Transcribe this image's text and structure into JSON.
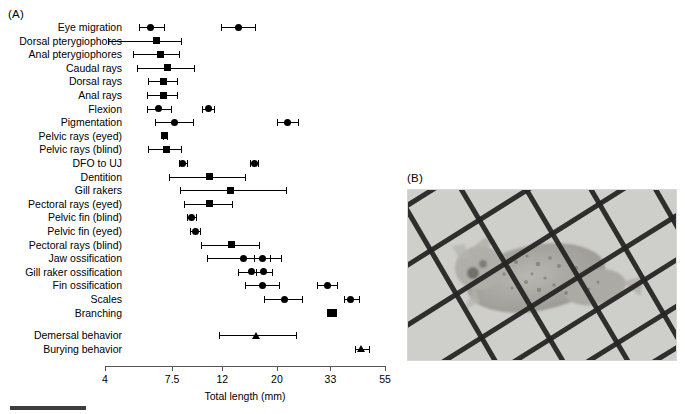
{
  "figure": {
    "panels": [
      {
        "id": "A",
        "letter": "(A)"
      },
      {
        "id": "B",
        "letter": "(B)"
      }
    ]
  },
  "panel_a": {
    "axis_title": "Total length (mm)",
    "axis_ticks": [
      "4",
      "7.5",
      "12",
      "20",
      "33",
      "55"
    ]
  },
  "panel_b": {
    "letter": "(B)",
    "image_description": "grayscale photograph of a settled flatfish larva lying on a dark diagonal grid mesh"
  },
  "chart_data": {
    "type": "scatter",
    "title": "",
    "xlabel": "Total length (mm)",
    "ylabel": "",
    "xscale": "log",
    "xlim": [
      4,
      55
    ],
    "xticks": [
      4,
      7.5,
      12,
      20,
      33,
      55
    ],
    "grid": false,
    "legend": null,
    "categories": [
      "Eye migration",
      "Dorsal pterygiophores",
      "Anal pterygiophores",
      "Caudal rays",
      "Dorsal rays",
      "Anal rays",
      "Flexion",
      "Pigmentation",
      "Pelvic rays (eyed)",
      "Pelvic rays (blind)",
      "DFO to UJ",
      "Dentition",
      "Gill rakers",
      "Pectoral rays (eyed)",
      "Pelvic fin (blind)",
      "Pelvic fin (eyed)",
      "Pectoral rays (blind)",
      "Jaw ossification",
      "Gill raker ossification",
      "Fin ossification",
      "Scales",
      "Branching",
      "Demersal behavior",
      "Burying behavior"
    ],
    "series": [
      {
        "name": "Developmental event intervals",
        "rows": [
          {
            "category": "Eye migration",
            "gap_after": false,
            "points": [
              {
                "marker": "circle",
                "value": 6.1,
                "low": 5.5,
                "high": 7.0
              },
              {
                "marker": "circle",
                "value": 14.0,
                "low": 11.9,
                "high": 16.5
              }
            ]
          },
          {
            "category": "Dorsal pterygiophores",
            "gap_after": false,
            "points": [
              {
                "marker": "square",
                "value": 6.5,
                "low": 4.1,
                "high": 8.2
              }
            ]
          },
          {
            "category": "Anal pterygiophores",
            "gap_after": false,
            "points": [
              {
                "marker": "square",
                "value": 6.7,
                "low": 5.2,
                "high": 8.1
              }
            ]
          },
          {
            "category": "Caudal rays",
            "gap_after": false,
            "points": [
              {
                "marker": "square",
                "value": 7.2,
                "low": 5.4,
                "high": 9.3
              }
            ]
          },
          {
            "category": "Dorsal rays",
            "gap_after": false,
            "points": [
              {
                "marker": "square",
                "value": 6.9,
                "low": 6.0,
                "high": 7.9
              }
            ]
          },
          {
            "category": "Anal rays",
            "gap_after": false,
            "points": [
              {
                "marker": "square",
                "value": 6.9,
                "low": 5.9,
                "high": 7.9
              }
            ]
          },
          {
            "category": "Flexion",
            "gap_after": false,
            "points": [
              {
                "marker": "circle",
                "value": 6.6,
                "low": 5.9,
                "high": 7.5
              },
              {
                "marker": "circle",
                "value": 10.5,
                "low": 9.9,
                "high": 11.2
              }
            ]
          },
          {
            "category": "Pigmentation",
            "gap_after": false,
            "points": [
              {
                "marker": "circle",
                "value": 7.7,
                "low": 6.4,
                "high": 9.2
              },
              {
                "marker": "circle",
                "value": 22.0,
                "low": 20.0,
                "high": 24.5
              }
            ]
          },
          {
            "category": "Pelvic rays (eyed)",
            "gap_after": false,
            "points": [
              {
                "marker": "square",
                "value": 7.0,
                "low": 6.9,
                "high": 7.2
              }
            ]
          },
          {
            "category": "Pelvic rays (blind)",
            "gap_after": false,
            "points": [
              {
                "marker": "square",
                "value": 7.1,
                "low": 6.0,
                "high": 8.2
              }
            ]
          },
          {
            "category": "DFO to UJ",
            "gap_after": false,
            "points": [
              {
                "marker": "circle",
                "value": 8.3,
                "low": 8.0,
                "high": 8.7
              },
              {
                "marker": "circle",
                "value": 16.2,
                "low": 15.6,
                "high": 16.9
              }
            ]
          },
          {
            "category": "Dentition",
            "gap_after": false,
            "points": [
              {
                "marker": "square",
                "value": 10.6,
                "low": 7.3,
                "high": 15.0
              }
            ]
          },
          {
            "category": "Gill rakers",
            "gap_after": false,
            "points": [
              {
                "marker": "square",
                "value": 13.0,
                "low": 8.1,
                "high": 22.0
              }
            ]
          },
          {
            "category": "Pectoral rays (eyed)",
            "gap_after": false,
            "points": [
              {
                "marker": "square",
                "value": 10.6,
                "low": 8.4,
                "high": 13.3
              }
            ]
          },
          {
            "category": "Pelvic fin (blind)",
            "gap_after": false,
            "points": [
              {
                "marker": "circle",
                "value": 9.0,
                "low": 8.6,
                "high": 9.5
              }
            ]
          },
          {
            "category": "Pelvic fin (eyed)",
            "gap_after": false,
            "points": [
              {
                "marker": "circle",
                "value": 9.3,
                "low": 8.9,
                "high": 9.8
              }
            ]
          },
          {
            "category": "Pectoral rays (blind)",
            "gap_after": false,
            "points": [
              {
                "marker": "square",
                "value": 13.1,
                "low": 9.8,
                "high": 17.0
              }
            ]
          },
          {
            "category": "Jaw ossification",
            "gap_after": false,
            "points": [
              {
                "marker": "circle",
                "value": 14.6,
                "low": 10.4,
                "high": 19.0
              },
              {
                "marker": "circle",
                "value": 17.5,
                "low": 16.2,
                "high": 21.0
              }
            ]
          },
          {
            "category": "Gill raker ossification",
            "gap_after": false,
            "points": [
              {
                "marker": "circle",
                "value": 15.8,
                "low": 13.9,
                "high": 19.3
              },
              {
                "marker": "circle",
                "value": 17.6,
                "low": 16.4,
                "high": 19.3
              }
            ]
          },
          {
            "category": "Fin ossification",
            "gap_after": false,
            "points": [
              {
                "marker": "circle",
                "value": 17.5,
                "low": 14.9,
                "high": 20.5
              },
              {
                "marker": "circle",
                "value": 32.0,
                "low": 29.0,
                "high": 35.5
              }
            ]
          },
          {
            "category": "Scales",
            "gap_after": false,
            "points": [
              {
                "marker": "circle",
                "value": 21.5,
                "low": 17.8,
                "high": 25.5
              },
              {
                "marker": "circle",
                "value": 40.0,
                "low": 37.5,
                "high": 43.5
              }
            ]
          },
          {
            "category": "Branching",
            "gap_after": true,
            "points": [
              {
                "marker": "square-wide",
                "value": 33.5,
                "low": 33.0,
                "high": 34.0
              }
            ]
          },
          {
            "category": "Demersal behavior",
            "gap_after": false,
            "points": [
              {
                "marker": "triangle",
                "value": 16.5,
                "low": 11.6,
                "high": 24.2
              }
            ]
          },
          {
            "category": "Burying behavior",
            "gap_after": false,
            "points": [
              {
                "marker": "triangle",
                "value": 44.0,
                "low": 41.5,
                "high": 48.0
              }
            ]
          }
        ]
      }
    ]
  }
}
